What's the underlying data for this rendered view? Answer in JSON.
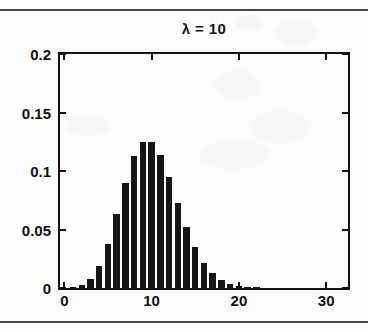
{
  "figure": {
    "separator_top": "rule",
    "separator_bottom": "rule"
  },
  "chart_data": {
    "type": "bar",
    "title": "λ = 10",
    "xlabel": "",
    "ylabel": "",
    "xlim": [
      -0.5,
      32.5
    ],
    "ylim": [
      0,
      0.2
    ],
    "grid": false,
    "legend": null,
    "bar_color": "#161616",
    "axis_color": "#121212",
    "xticks": [
      0,
      10,
      20,
      30
    ],
    "xtick_labels": [
      "0",
      "10",
      "20",
      "30"
    ],
    "yticks": [
      0,
      0.05,
      0.1,
      0.15,
      0.2
    ],
    "ytick_labels": [
      "0",
      "0.05",
      "0.1",
      "0.15",
      "0.2"
    ],
    "categories": [
      0,
      1,
      2,
      3,
      4,
      5,
      6,
      7,
      8,
      9,
      10,
      11,
      12,
      13,
      14,
      15,
      16,
      17,
      18,
      19,
      20,
      21,
      22,
      23,
      24,
      25,
      26,
      27,
      28,
      29,
      30,
      31,
      32
    ],
    "values": [
      0.0,
      0.0005,
      0.0023,
      0.0076,
      0.0189,
      0.0378,
      0.0631,
      0.0901,
      0.1126,
      0.1251,
      0.1251,
      0.1137,
      0.0948,
      0.0729,
      0.0521,
      0.0347,
      0.0217,
      0.0128,
      0.0071,
      0.0037,
      0.0019,
      0.0009,
      0.0004,
      0.0002,
      0.0001,
      0.0,
      0.0,
      0.0,
      0.0,
      0.0,
      0.0,
      0.0,
      0.0
    ],
    "series": [
      {
        "name": "Poisson pmf",
        "values": [
          0.0,
          0.0005,
          0.0023,
          0.0076,
          0.0189,
          0.0378,
          0.0631,
          0.0901,
          0.1126,
          0.1251,
          0.1251,
          0.1137,
          0.0948,
          0.0729,
          0.0521,
          0.0347,
          0.0217,
          0.0128,
          0.0071,
          0.0037,
          0.0019,
          0.0009,
          0.0004,
          0.0002,
          0.0001,
          0.0,
          0.0,
          0.0,
          0.0,
          0.0,
          0.0,
          0.0,
          0.0
        ]
      }
    ]
  }
}
